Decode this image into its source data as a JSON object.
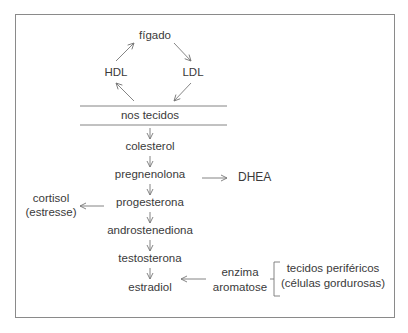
{
  "diagram": {
    "cycle": {
      "top": "fígado",
      "left": "HDL",
      "right": "LDL",
      "bottom": "nos tecidos"
    },
    "pathway": [
      "colesterol",
      "pregnenolona",
      "progesterona",
      "androstenediona",
      "testosterona",
      "estradiol"
    ],
    "branches": {
      "dhea": "DHEA",
      "cortisol_line1": "cortisol",
      "cortisol_line2": "(estresse)",
      "enzyme_line1": "enzima",
      "enzyme_line2": "aromatose",
      "source_line1": "tecidos periféricos",
      "source_line2": "(células gordurosas)"
    },
    "colors": {
      "border": "#8a8a8a",
      "text": "#3a3a3a",
      "arrow": "#777777"
    }
  }
}
